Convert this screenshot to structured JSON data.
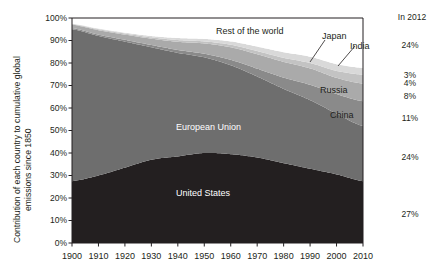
{
  "axis": {
    "y_title_line1": "Contribution of each country to cumulative global",
    "y_title_line2": "emissions since 1850",
    "y_ticks": [
      "100%",
      "90%",
      "80%",
      "70%",
      "60%",
      "50%",
      "40%",
      "30%",
      "20%",
      "10%",
      "0%"
    ],
    "x_ticks": [
      "1900",
      "1910",
      "1920",
      "1930",
      "1940",
      "1950",
      "1960",
      "1970",
      "1980",
      "1990",
      "2000",
      "2010"
    ]
  },
  "right_column": {
    "header": "In 2012",
    "values": [
      "24%",
      "3%",
      "4%",
      "8%",
      "11%",
      "24%",
      "27%"
    ]
  },
  "band_labels": {
    "rest_of_world": "Rest of the world",
    "japan": "Japan",
    "india": "India",
    "russia": "Russia",
    "china": "China",
    "european_union": "European Union",
    "united_states": "United States"
  },
  "colors": {
    "rest_of_world": "#ffffff",
    "japan": "#d9d9d9",
    "india": "#c3c3c3",
    "russia": "#aaaaaa",
    "china": "#8a8a8a",
    "european_union": "#6e6e6e",
    "united_states": "#231f20",
    "frame": "#231f20",
    "text": "#231f20"
  },
  "chart_data": {
    "type": "area",
    "title": "",
    "subtitle": "",
    "xlabel": "",
    "ylabel": "Contribution of each country to cumulative global emissions since 1850",
    "xlim": [
      1900,
      2010
    ],
    "ylim": [
      0,
      100
    ],
    "grid": false,
    "legend": "in-plot labels plus right-hand 2012 value column",
    "stacked": true,
    "stack_order_bottom_to_top": [
      "United States",
      "European Union",
      "China",
      "Russia",
      "India",
      "Japan",
      "Rest of the world"
    ],
    "x": [
      1900,
      1910,
      1920,
      1930,
      1940,
      1950,
      1960,
      1970,
      1980,
      1990,
      2000,
      2010
    ],
    "series": [
      {
        "name": "United States",
        "values": [
          27.5,
          30.0,
          33.5,
          37.0,
          38.5,
          40.0,
          39.5,
          38.0,
          35.5,
          33.0,
          30.5,
          27.5
        ],
        "value_2012": 27,
        "label_color": "#ffffff"
      },
      {
        "name": "European Union",
        "values": [
          67.5,
          62.0,
          56.0,
          50.0,
          46.0,
          42.5,
          39.5,
          36.0,
          33.0,
          30.5,
          27.0,
          24.5
        ],
        "value_2012": 24,
        "label_color": "#ffffff"
      },
      {
        "name": "China",
        "values": [
          0.5,
          0.6,
          0.8,
          1.0,
          1.3,
          1.6,
          2.4,
          3.5,
          5.0,
          6.8,
          8.7,
          11.0
        ],
        "value_2012": 11,
        "label_color": "#ffffff"
      },
      {
        "name": "Russia",
        "values": [
          1.5,
          2.0,
          2.3,
          2.8,
          3.6,
          4.6,
          5.6,
          6.4,
          7.0,
          7.3,
          7.2,
          7.8
        ],
        "value_2012": 8,
        "label_color": "#231f20"
      },
      {
        "name": "India",
        "values": [
          0.3,
          0.4,
          0.5,
          0.6,
          0.8,
          0.9,
          1.1,
          1.4,
          1.8,
          2.4,
          3.1,
          4.0
        ],
        "value_2012": 4,
        "label_color": "#231f20"
      },
      {
        "name": "Japan",
        "values": [
          0.2,
          0.3,
          0.4,
          0.6,
          0.9,
          1.1,
          1.5,
          2.0,
          2.5,
          2.8,
          3.0,
          3.0
        ],
        "value_2012": 3,
        "label_color": "#231f20"
      },
      {
        "name": "Rest of the world",
        "values": [
          2.5,
          4.7,
          6.5,
          8.0,
          8.9,
          9.3,
          10.4,
          12.7,
          15.2,
          17.2,
          20.5,
          22.2
        ],
        "value_2012": 24,
        "label_color": "#231f20"
      }
    ]
  }
}
